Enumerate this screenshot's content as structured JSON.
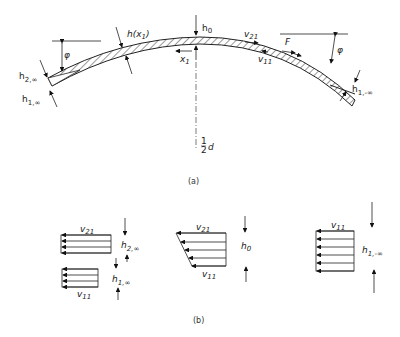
{
  "diagram": {
    "part_a": {
      "caption": "(a)",
      "labels": {
        "h0": "h",
        "h0_sub": "0",
        "h_x1": "h(x",
        "h_x1_sub": "1",
        "h_x1_close": ")",
        "x1": "x",
        "x1_sub": "1",
        "phi_left": "φ",
        "phi_right": "φ",
        "h2_inf": "h",
        "h2_inf_sub": "2,∞",
        "h1_inf": "h",
        "h1_inf_sub": "1,∞",
        "v21": "v",
        "v21_sub": "21",
        "v11": "v",
        "v11_sub": "11",
        "F": "F",
        "h1_neg_inf": "h",
        "h1_neg_inf_sub": "1,-∞",
        "half_d_num": "1",
        "half_d_den": "2",
        "half_d_var": "d"
      }
    },
    "part_b": {
      "caption": "(b)",
      "profiles": [
        {
          "name": "inflow-profiles",
          "upper_label": "v",
          "upper_sub": "21",
          "upper_h": "h",
          "upper_h_sub": "2,∞",
          "lower_label": "v",
          "lower_sub": "11",
          "lower_h": "h",
          "lower_h_sub": "1,∞"
        },
        {
          "name": "center-profile",
          "top_label": "v",
          "top_sub": "21",
          "bottom_label": "v",
          "bottom_sub": "11",
          "h": "h",
          "h_sub": "0"
        },
        {
          "name": "outflow-profile",
          "top_label": "v",
          "top_sub": "11",
          "h": "h",
          "h_sub": "1,-∞"
        }
      ]
    }
  }
}
